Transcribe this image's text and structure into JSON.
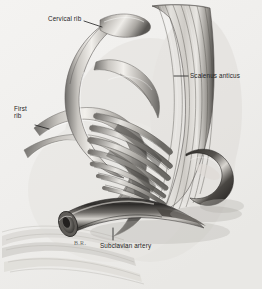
{
  "figure": {
    "medium": "grayscale pencil and wash anatomical illustration",
    "background_color": "#f1f0ee",
    "ink_color": "#1d1d1d",
    "width": 262,
    "height": 289
  },
  "labels": [
    {
      "id": "cervical-rib",
      "text": "Cervical rib",
      "x": 48,
      "y": 15,
      "leader": {
        "from_x": 84,
        "from_y": 21,
        "to_x": 102,
        "to_y": 27
      }
    },
    {
      "id": "scalenus-anticus",
      "text": "Scalenus anticus",
      "x": 190,
      "y": 72,
      "leader": {
        "from_x": 188,
        "from_y": 76,
        "to_x": 174,
        "to_y": 76
      }
    },
    {
      "id": "first-rib",
      "text": "First rib",
      "line_1": "First",
      "line_2": "rib",
      "x": 14,
      "y": 105,
      "leader": {
        "from_x": 35,
        "from_y": 125,
        "to_x": 49,
        "to_y": 129
      }
    },
    {
      "id": "subclavian-artery",
      "text": "Subclavian artery",
      "x": 100,
      "y": 242,
      "leader": {
        "from_x": 113,
        "from_y": 240,
        "to_x": 113,
        "to_y": 228
      }
    }
  ],
  "signature": {
    "text": "B.R.",
    "x": 74,
    "y": 240
  },
  "structures": [
    {
      "name": "cervical-rib",
      "description": "anomalous extra rib arching from upper left across the center"
    },
    {
      "name": "first-rib",
      "description": "broad curved rib entering from the left beneath the cervical rib"
    },
    {
      "name": "scalenus-anticus-muscle",
      "description": "vertically striated muscle band descending the right side"
    },
    {
      "name": "brachial-plexus",
      "description": "diagonal bundle of nerve trunks fanning across the center"
    },
    {
      "name": "subclavian-artery",
      "description": "cut tubular vessel at lower left with open elliptical lumen"
    },
    {
      "name": "clavicle-shadow",
      "description": "dark rounded structure at right below the muscle"
    }
  ]
}
